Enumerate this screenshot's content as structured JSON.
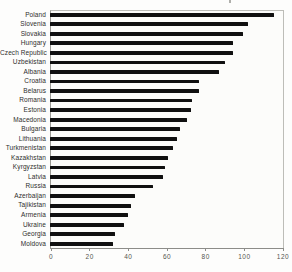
{
  "chart_data": {
    "type": "bar",
    "orientation": "horizontal",
    "title": "",
    "xlabel": "",
    "ylabel": "",
    "categories": [
      "Poland",
      "Slovenia",
      "Slovakia",
      "Hungary",
      "Czech Republic",
      "Uzbekistan",
      "Albania",
      "Croatia",
      "Belarus",
      "Romania",
      "Estonia",
      "Macedonia",
      "Bulgaria",
      "Lithuania",
      "Turkmenistan",
      "Kazakhstan",
      "Kyrgyzstan",
      "Latvia",
      "Russia",
      "Azerbaijan",
      "Tajikistan",
      "Armenia",
      "Ukraine",
      "Georgia",
      "Moldova"
    ],
    "values": [
      115.5,
      102,
      99.5,
      94.5,
      94,
      90,
      87,
      76.5,
      76.5,
      73,
      72.5,
      70.5,
      67,
      65.5,
      63.5,
      61,
      59,
      58,
      53,
      44,
      41.5,
      40,
      38,
      33.5,
      32.5
    ],
    "xlim": [
      0,
      120
    ],
    "xticks": [
      0,
      20,
      40,
      60,
      80,
      100,
      120
    ],
    "grid": false,
    "legend": null,
    "bar_color": "#101010",
    "background_color": "#fcfcfa",
    "frame_color": "#bdbdb8",
    "axis_color": "#8c8c88",
    "category_label_color": "#2e2e2c",
    "tick_label_color": "#55554f"
  }
}
